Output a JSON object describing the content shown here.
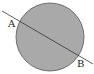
{
  "diagram": {
    "labels": {
      "a": "A",
      "b": "B"
    },
    "colors": {
      "circle_fill": "#a8a8a8",
      "circle_stroke": "#555555",
      "line": "#333333"
    }
  }
}
